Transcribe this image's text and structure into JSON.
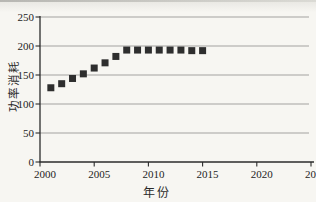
{
  "page": {
    "background": "#f7f6f2",
    "description_labels": {}
  },
  "chart_data": {
    "type": "scatter",
    "title": "",
    "xlabel": "年份",
    "ylabel": "功率消耗",
    "xlim": [
      2000,
      2025
    ],
    "ylim": [
      0,
      250
    ],
    "xticks": [
      2000,
      2005,
      2010,
      2015,
      2020,
      2025
    ],
    "yticks": [
      0,
      50,
      100,
      150,
      200,
      250
    ],
    "grid": "horizontal",
    "legend": "none",
    "marker": "filled-square",
    "marker_color": "#2e2e2e",
    "axis_color": "#2b2b2b",
    "gridline_color": "#999996",
    "points": [
      {
        "x": 2001,
        "y": 128
      },
      {
        "x": 2002,
        "y": 135
      },
      {
        "x": 2003,
        "y": 144
      },
      {
        "x": 2004,
        "y": 152
      },
      {
        "x": 2005,
        "y": 162
      },
      {
        "x": 2006,
        "y": 171
      },
      {
        "x": 2007,
        "y": 182
      },
      {
        "x": 2008,
        "y": 193
      },
      {
        "x": 2009,
        "y": 193
      },
      {
        "x": 2010,
        "y": 193
      },
      {
        "x": 2011,
        "y": 193
      },
      {
        "x": 2012,
        "y": 193
      },
      {
        "x": 2013,
        "y": 193
      },
      {
        "x": 2014,
        "y": 192
      },
      {
        "x": 2015,
        "y": 192
      }
    ]
  }
}
